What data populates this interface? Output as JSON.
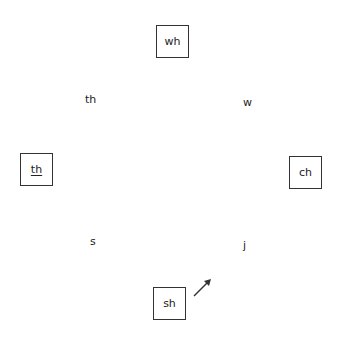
{
  "diagram": {
    "boxed_items": [
      {
        "id": "top",
        "label": "wh",
        "underlined": false
      },
      {
        "id": "left",
        "label": "th",
        "underlined": true
      },
      {
        "id": "right",
        "label": "ch",
        "underlined": false
      },
      {
        "id": "bottom",
        "label": "sh",
        "underlined": false
      }
    ],
    "free_labels": [
      {
        "id": "upper-left",
        "label": "th"
      },
      {
        "id": "upper-right",
        "label": "w"
      },
      {
        "id": "lower-left",
        "label": "s"
      },
      {
        "id": "lower-right",
        "label": "j"
      }
    ],
    "arrow": {
      "direction": "up-right",
      "near": "sh"
    }
  }
}
